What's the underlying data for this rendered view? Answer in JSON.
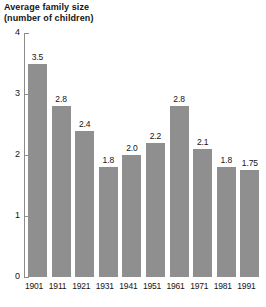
{
  "chart_data": {
    "type": "bar",
    "title": "Average family size",
    "subtitle": "(number of children)",
    "xlabel": "",
    "ylabel": "",
    "ylim": [
      0,
      4
    ],
    "yticks": [
      "0",
      "1",
      "2",
      "3",
      "4"
    ],
    "grid": false,
    "legend": false,
    "bar_color": "#8f8f8f",
    "axis_color": "#8c8c8c",
    "text_color": "#141414",
    "background": "#ffffff",
    "categories": [
      "1901",
      "1911",
      "1921",
      "1931",
      "1941",
      "1951",
      "1961",
      "1971",
      "1981",
      "1991"
    ],
    "values": [
      3.5,
      2.8,
      2.4,
      1.8,
      2.0,
      2.2,
      2.8,
      2.1,
      1.8,
      1.75
    ],
    "value_labels": [
      "3.5",
      "2.8",
      "2.4",
      "1.8",
      "2.0",
      "2.2",
      "2.8",
      "2.1",
      "1.8",
      "1.75"
    ]
  }
}
